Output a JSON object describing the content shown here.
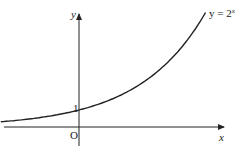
{
  "chart_data": {
    "type": "line",
    "title": "",
    "function": "y = 2^x",
    "curve_label": "y = 2",
    "curve_label_exponent": "x",
    "xlabel": "x",
    "ylabel": "y",
    "origin_label": "O",
    "y_intercept_label": "1",
    "y_intercept": 1,
    "x_range": [
      -1.7,
      2.75
    ],
    "grid": false,
    "series": [
      {
        "name": "y = 2^x",
        "x": [
          -1.7,
          -1,
          0,
          1,
          2,
          2.75
        ],
        "values": [
          0.31,
          0.5,
          1,
          2,
          4,
          6.73
        ]
      }
    ]
  },
  "colors": {
    "axis": "#222222",
    "curve": "#222222",
    "background": "#ffffff"
  }
}
